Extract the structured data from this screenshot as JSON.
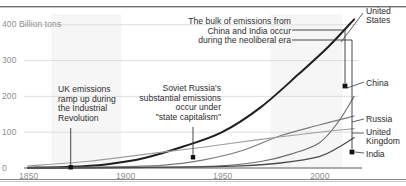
{
  "chart_data": {
    "type": "line",
    "title": "",
    "xlabel": "",
    "ylabel": "400 Billion tons",
    "yunit_label": "400 Billion tons",
    "xlim": [
      1850,
      2020
    ],
    "ylim": [
      0,
      430
    ],
    "grid": true,
    "legend_position": "right-inline",
    "yticks": [
      "0",
      "100",
      "200",
      "300",
      "400 Billion tons"
    ],
    "ytick_values": [
      0,
      100,
      200,
      300,
      400
    ],
    "xticks": [
      "1850",
      "1900",
      "1950",
      "2000"
    ],
    "xtick_values": [
      1850,
      1900,
      1950,
      2000
    ],
    "series": [
      {
        "name": "United States",
        "label": "United\nStates",
        "color": "#1f1f1f",
        "x": [
          1850,
          1870,
          1890,
          1910,
          1930,
          1950,
          1970,
          1990,
          2005,
          2018
        ],
        "values": [
          1,
          3,
          10,
          28,
          60,
          100,
          170,
          265,
          340,
          415
        ]
      },
      {
        "name": "China",
        "label": "China",
        "color": "#6b6b6b",
        "x": [
          1850,
          1900,
          1930,
          1950,
          1970,
          1985,
          2000,
          2010,
          2018
        ],
        "values": [
          0,
          1,
          3,
          6,
          18,
          38,
          70,
          130,
          200
        ]
      },
      {
        "name": "Russia",
        "label": "Russia",
        "color": "#7a7a7a",
        "x": [
          1850,
          1900,
          1920,
          1940,
          1960,
          1980,
          2000,
          2018
        ],
        "values": [
          0,
          4,
          8,
          22,
          48,
          90,
          120,
          145
        ]
      },
      {
        "name": "United Kingdom",
        "label": "United\nKingdom",
        "color": "#9e9e9e",
        "x": [
          1850,
          1880,
          1910,
          1940,
          1970,
          2000,
          2018
        ],
        "values": [
          6,
          18,
          38,
          58,
          80,
          100,
          110
        ]
      },
      {
        "name": "India",
        "label": "India",
        "color": "#4a4a4a",
        "x": [
          1850,
          1900,
          1940,
          1960,
          1980,
          2000,
          2010,
          2018
        ],
        "values": [
          0,
          1,
          3,
          6,
          14,
          32,
          58,
          85
        ]
      }
    ],
    "annotations": [
      {
        "id": "uk-industrial-revolution",
        "text": "UK emissions\nramp up during\nthe Industrial\nRevolution",
        "point_x": 1872,
        "point_y": 2
      },
      {
        "id": "soviet-state-capitalism",
        "text": "Soviet Russia's\nsubstantial emissions\noccur under\n\"state capitalism\"",
        "point_x": 1935,
        "point_y": 30
      },
      {
        "id": "china-india-neoliberal",
        "text": "The bulk of emissions from\nChina and India occur\nduring the neoliberal era",
        "point_x": 2012,
        "point_y": 185
      }
    ],
    "shaded_regions": [
      {
        "id": "industrial-revolution-band",
        "x_start": 1862,
        "x_end": 1898
      },
      {
        "id": "neoliberal-era-band",
        "x_start": 1975,
        "x_end": 2012
      }
    ]
  }
}
